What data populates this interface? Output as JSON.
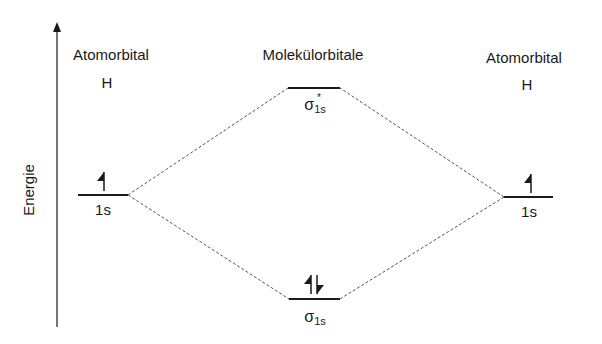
{
  "axis": {
    "label": "Energie"
  },
  "columns": {
    "left": {
      "title": "Atomorbital",
      "element": "H",
      "orbital": "1s",
      "electrons": "up"
    },
    "middle": {
      "title": "Molekülorbitale"
    },
    "right": {
      "title": "Atomorbital",
      "element": "H",
      "orbital": "1s",
      "electrons": "up"
    }
  },
  "mo": {
    "antibonding": {
      "symbol": "σ",
      "subscript": "1s",
      "star": "*",
      "electrons": "none"
    },
    "bonding": {
      "symbol": "σ",
      "subscript": "1s",
      "electrons": "up-down"
    }
  },
  "colors": {
    "line": "#1a1a1a",
    "dashed": "#555555"
  }
}
